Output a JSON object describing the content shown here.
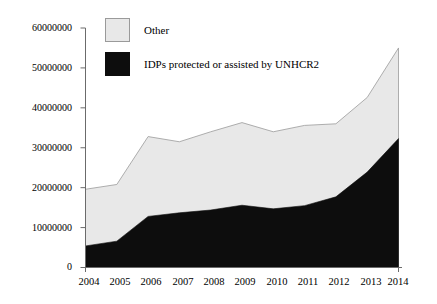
{
  "chart_data": {
    "type": "area",
    "stacked": true,
    "title": "",
    "subtitle": "",
    "xlabel": "",
    "ylabel": "",
    "categories": [
      "2004",
      "2005",
      "2006",
      "2007",
      "2008",
      "2009",
      "2010",
      "2011",
      "2012",
      "2013",
      "2014"
    ],
    "x": [
      2004,
      2005,
      2006,
      2007,
      2008,
      2009,
      2010,
      2011,
      2012,
      2013,
      2014
    ],
    "series": [
      {
        "name": "IDPs protected or assisted by UNHCR2",
        "color": "#0d0d0d",
        "values": [
          5400000,
          6600000,
          12800000,
          13700000,
          14400000,
          15600000,
          14700000,
          15500000,
          17700000,
          23900000,
          32300000
        ]
      },
      {
        "name": "Other",
        "color": "#e8e8e8",
        "values": [
          14200000,
          14200000,
          20000000,
          17800000,
          19600000,
          20700000,
          19300000,
          20100000,
          18300000,
          18700000,
          22700000
        ]
      }
    ],
    "totals": [
      19600000,
      20800000,
      32800000,
      31500000,
      34000000,
      36300000,
      34000000,
      35600000,
      36000000,
      42600000,
      55000000
    ],
    "ylim": [
      0,
      60000000
    ],
    "yticks": [
      0,
      10000000,
      20000000,
      30000000,
      40000000,
      50000000,
      60000000
    ],
    "ytick_labels": [
      "0",
      "10000000",
      "20000000",
      "30000000",
      "40000000",
      "50000000",
      "60000000"
    ],
    "grid": false,
    "legend_position": "top-center"
  },
  "legend": {
    "items": [
      {
        "label": "Other",
        "color": "#e8e8e8",
        "swatch": "legend-swatch-other"
      },
      {
        "label": "IDPs protected or assisted by UNHCR2",
        "color": "#0d0d0d",
        "swatch": "legend-swatch-idps"
      }
    ]
  },
  "axes": {
    "y_tick_labels": [
      "60000000",
      "50000000",
      "40000000",
      "30000000",
      "20000000",
      "10000000",
      "0"
    ],
    "x_tick_labels": [
      "2004",
      "2005",
      "2006",
      "2007",
      "2008",
      "2009",
      "2010",
      "2011",
      "2012",
      "2013",
      "2014"
    ]
  }
}
